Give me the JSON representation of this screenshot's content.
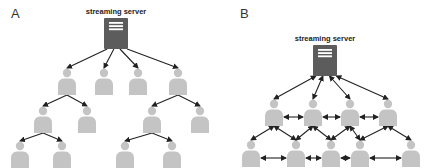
{
  "colors": {
    "server_fill": "#5c5c5c",
    "server_stripe": "#ffffff",
    "person_fill": "#c4c4c4",
    "arrow": "#222222"
  },
  "panels": [
    {
      "label": "A",
      "title": "Tree-based P2P streaming",
      "server": {
        "label": "streaming server",
        "x": 116,
        "y": 18,
        "w": 24,
        "h": 31
      },
      "nodes": [
        {
          "id": "a1",
          "x": 67,
          "y": 73
        },
        {
          "id": "a2",
          "x": 104,
          "y": 73
        },
        {
          "id": "a3",
          "x": 138,
          "y": 73
        },
        {
          "id": "a4",
          "x": 178,
          "y": 73
        },
        {
          "id": "a5",
          "x": 43,
          "y": 111
        },
        {
          "id": "a6",
          "x": 87,
          "y": 111
        },
        {
          "id": "a7",
          "x": 152,
          "y": 111
        },
        {
          "id": "a8",
          "x": 200,
          "y": 111
        },
        {
          "id": "a9",
          "x": 20,
          "y": 146
        },
        {
          "id": "a10",
          "x": 62,
          "y": 146
        },
        {
          "id": "a11",
          "x": 125,
          "y": 146
        },
        {
          "id": "a12",
          "x": 172,
          "y": 146
        }
      ],
      "edges": [
        {
          "from": "server",
          "to": "a1",
          "dir": "forward"
        },
        {
          "from": "server",
          "to": "a2",
          "dir": "forward"
        },
        {
          "from": "server",
          "to": "a3",
          "dir": "forward"
        },
        {
          "from": "server",
          "to": "a4",
          "dir": "forward"
        },
        {
          "from": "a1",
          "to": "a5",
          "dir": "forward"
        },
        {
          "from": "a1",
          "to": "a6",
          "dir": "forward"
        },
        {
          "from": "a4",
          "to": "a7",
          "dir": "forward"
        },
        {
          "from": "a4",
          "to": "a8",
          "dir": "forward"
        },
        {
          "from": "a5",
          "to": "a9",
          "dir": "forward"
        },
        {
          "from": "a5",
          "to": "a10",
          "dir": "forward"
        },
        {
          "from": "a7",
          "to": "a11",
          "dir": "forward"
        },
        {
          "from": "a7",
          "to": "a12",
          "dir": "forward"
        }
      ]
    },
    {
      "label": "B",
      "title": "Mesh-based P2P streaming",
      "server": {
        "label": "streaming server",
        "x": 325,
        "y": 45,
        "w": 24,
        "h": 31
      },
      "nodes": [
        {
          "id": "b1",
          "x": 274,
          "y": 104
        },
        {
          "id": "b2",
          "x": 313,
          "y": 104
        },
        {
          "id": "b3",
          "x": 350,
          "y": 104
        },
        {
          "id": "b4",
          "x": 388,
          "y": 104
        },
        {
          "id": "b5",
          "x": 251,
          "y": 145
        },
        {
          "id": "b6",
          "x": 296,
          "y": 145
        },
        {
          "id": "b7",
          "x": 331,
          "y": 145
        },
        {
          "id": "b8",
          "x": 360,
          "y": 145
        },
        {
          "id": "b9",
          "x": 411,
          "y": 145
        }
      ],
      "edges": [
        {
          "from": "server",
          "to": "b1",
          "dir": "both"
        },
        {
          "from": "server",
          "to": "b2",
          "dir": "both"
        },
        {
          "from": "server",
          "to": "b3",
          "dir": "both"
        },
        {
          "from": "server",
          "to": "b4",
          "dir": "both"
        },
        {
          "from": "b1",
          "to": "b2",
          "dir": "both",
          "lateral": true
        },
        {
          "from": "b2",
          "to": "b3",
          "dir": "both",
          "lateral": true
        },
        {
          "from": "b3",
          "to": "b4",
          "dir": "both",
          "lateral": true
        },
        {
          "from": "b1",
          "to": "b5",
          "dir": "both"
        },
        {
          "from": "b1",
          "to": "b6",
          "dir": "both"
        },
        {
          "from": "b2",
          "to": "b6",
          "dir": "both"
        },
        {
          "from": "b2",
          "to": "b7",
          "dir": "both"
        },
        {
          "from": "b3",
          "to": "b7",
          "dir": "both"
        },
        {
          "from": "b3",
          "to": "b8",
          "dir": "both"
        },
        {
          "from": "b4",
          "to": "b8",
          "dir": "both"
        },
        {
          "from": "b4",
          "to": "b9",
          "dir": "both"
        },
        {
          "from": "b5",
          "to": "b6",
          "dir": "both",
          "lateral": true
        },
        {
          "from": "b6",
          "to": "b7",
          "dir": "both",
          "lateral": true
        },
        {
          "from": "b7",
          "to": "b8",
          "dir": "both",
          "lateral": true
        },
        {
          "from": "b8",
          "to": "b9",
          "dir": "both",
          "lateral": true
        }
      ]
    }
  ]
}
